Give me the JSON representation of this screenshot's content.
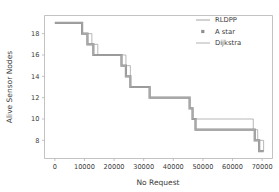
{
  "chart_data": {
    "type": "line",
    "title": "",
    "xlabel": "No Request",
    "ylabel": "Alive Sensor Nodes",
    "xlim": [
      -3500,
      73500
    ],
    "ylim": [
      6.3,
      19.7
    ],
    "xticks": [
      0,
      10000,
      20000,
      30000,
      40000,
      50000,
      60000,
      70000
    ],
    "xticklabels": [
      "0",
      "10000",
      "20000",
      "30000",
      "40000",
      "50000",
      "60000",
      "70000"
    ],
    "yticks": [
      8,
      10,
      12,
      14,
      16,
      18
    ],
    "yticklabels": [
      "8",
      "10",
      "12",
      "14",
      "16",
      "18"
    ],
    "grid": false,
    "drawstyle": "steps-post",
    "legend_position": "upper right",
    "series": [
      {
        "name": "RLDPP",
        "color": "#9a9a9a",
        "linewidth": 0.7,
        "marker": "none",
        "x": [
          0,
          7000,
          9200,
          12500,
          14500,
          21500,
          24000,
          25500,
          30500,
          32000,
          43500,
          45500,
          46500,
          64000,
          67000,
          68500,
          70500
        ],
        "y": [
          19,
          19,
          18,
          17,
          16,
          16,
          15,
          13,
          13,
          12,
          12,
          11,
          10,
          10,
          9,
          8,
          7
        ]
      },
      {
        "name": "A star",
        "color": "#8f8f8f",
        "linewidth": 2.2,
        "marker": "square",
        "x": [
          0,
          7000,
          9200,
          11000,
          13000,
          19500,
          22500,
          24000,
          25500,
          30500,
          32000,
          43500,
          45500,
          46500,
          47500,
          66000,
          67500,
          69000,
          70500
        ],
        "y": [
          19,
          19,
          18,
          17,
          16,
          16,
          15,
          14,
          13,
          13,
          12,
          12,
          11,
          10,
          9,
          9,
          8,
          7,
          7
        ]
      },
      {
        "name": "Dijkstra",
        "color": "#a8a8a8",
        "linewidth": 1.2,
        "marker": "none",
        "x": [
          0,
          7000,
          9200,
          11000,
          13000,
          19500,
          22500,
          24000,
          25500,
          30500,
          32000,
          43500,
          45500,
          46500,
          47500,
          66000,
          67500,
          69000,
          70500
        ],
        "y": [
          19,
          19,
          18,
          17,
          16,
          16,
          15,
          14,
          13,
          13,
          12,
          12,
          11,
          10,
          9,
          9,
          8,
          7,
          7
        ]
      }
    ]
  },
  "legend": {
    "entries": [
      {
        "label": "RLDPP",
        "style": "line",
        "color": "#9a9a9a"
      },
      {
        "label": "A star",
        "style": "marker",
        "color": "#8f8f8f"
      },
      {
        "label": "Dijkstra",
        "style": "line",
        "color": "#a8a8a8"
      }
    ]
  }
}
